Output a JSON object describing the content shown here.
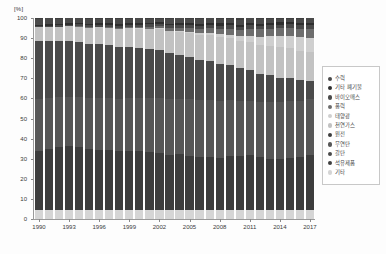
{
  "axes": {
    "unit_label": "[%]",
    "y_ticks": [
      "0",
      "10",
      "20",
      "30",
      "40",
      "50",
      "60",
      "70",
      "80",
      "90",
      "100"
    ],
    "x_ticks": [
      "1990",
      "1993",
      "1996",
      "1999",
      "2002",
      "2005",
      "2008",
      "2011",
      "2014",
      "2017"
    ]
  },
  "legend": {
    "items": [
      {
        "label": "수력",
        "color": "#4a4a4a"
      },
      {
        "label": "기타 폐기물",
        "color": "#2e2e2e"
      },
      {
        "label": "바이오매스",
        "color": "#4a4a4a"
      },
      {
        "label": "풍력",
        "color": "#6d6d6d"
      },
      {
        "label": "태양광",
        "color": "#cfcfcf"
      },
      {
        "label": "천연가스",
        "color": "#c2c2c2"
      },
      {
        "label": "원전",
        "color": "#3d3d3d"
      },
      {
        "label": "무연탄",
        "color": "#575757"
      },
      {
        "label": "갈탄",
        "color": "#4a4a4a"
      },
      {
        "label": "석유제품",
        "color": "#3f3f3f"
      },
      {
        "label": "기타",
        "color": "#d5d5d5"
      }
    ]
  },
  "chart_data": {
    "type": "area",
    "title": "",
    "xlabel": "",
    "ylabel": "[%]",
    "ylim": [
      0,
      100
    ],
    "grid": false,
    "legend_position": "right",
    "stacked": true,
    "normalized_percent": true,
    "x": [
      1990,
      1991,
      1992,
      1993,
      1994,
      1995,
      1996,
      1997,
      1998,
      1999,
      2000,
      2001,
      2002,
      2003,
      2004,
      2005,
      2006,
      2007,
      2008,
      2009,
      2010,
      2011,
      2012,
      2013,
      2014,
      2015,
      2016,
      2017
    ],
    "series": [
      {
        "name": "기타",
        "color": "#d5d5d5",
        "values": [
          4.3,
          4.3,
          4.3,
          4.3,
          4.3,
          4.3,
          4.4,
          4.4,
          4.4,
          4.4,
          4.4,
          4.4,
          4.4,
          4.4,
          4.4,
          4.4,
          4.4,
          4.4,
          4.4,
          4.5,
          4.5,
          4.5,
          4.5,
          4.5,
          4.6,
          4.6,
          4.7,
          4.7
        ]
      },
      {
        "name": "원전",
        "color": "#3d3d3d",
        "values": [
          29.5,
          30.5,
          31.5,
          32.0,
          31.5,
          30.5,
          30.0,
          30.0,
          29.5,
          29.5,
          29.5,
          29.0,
          28.5,
          28.0,
          28.0,
          27.5,
          27.0,
          27.0,
          27.0,
          28.0,
          28.0,
          28.5,
          28.0,
          27.0,
          27.0,
          27.5,
          28.0,
          28.5
        ]
      },
      {
        "name": "무연탄",
        "color": "#575757",
        "values": [
          26.0,
          25.5,
          25.0,
          24.5,
          25.0,
          25.5,
          26.0,
          26.0,
          26.0,
          26.5,
          26.5,
          27.0,
          27.5,
          28.0,
          28.0,
          28.5,
          29.0,
          29.0,
          29.0,
          28.5,
          28.5,
          28.0,
          28.5,
          29.5,
          30.0,
          30.0,
          30.0,
          29.5
        ]
      },
      {
        "name": "갈탄",
        "color": "#4a4a4a",
        "values": [
          29.0,
          28.5,
          28.0,
          28.0,
          27.5,
          27.0,
          26.5,
          26.0,
          25.5,
          25.0,
          24.5,
          24.0,
          23.5,
          23.0,
          22.0,
          21.0,
          20.5,
          20.0,
          19.0,
          18.0,
          17.0,
          16.0,
          15.0,
          14.0,
          13.0,
          12.0,
          11.0,
          9.5
        ]
      },
      {
        "name": "천연가스",
        "color": "#c2c2c2",
        "values": [
          6.5,
          6.5,
          6.8,
          7.0,
          7.5,
          8.0,
          8.5,
          8.8,
          9.3,
          9.5,
          9.8,
          10.2,
          10.8,
          11.0,
          11.5,
          12.0,
          12.5,
          13.0,
          14.0,
          13.5,
          14.0,
          14.5,
          15.0,
          15.5,
          16.0,
          16.0,
          15.5,
          15.0
        ]
      },
      {
        "name": "태양광",
        "color": "#cfcfcf",
        "values": [
          0.0,
          0.0,
          0.0,
          0.0,
          0.0,
          0.0,
          0.0,
          0.0,
          0.0,
          0.0,
          0.1,
          0.1,
          0.2,
          0.3,
          0.4,
          0.6,
          0.8,
          1.0,
          1.3,
          2.0,
          2.5,
          3.3,
          4.3,
          5.0,
          5.8,
          6.5,
          7.0,
          7.5
        ]
      },
      {
        "name": "풍력",
        "color": "#6d6d6d",
        "values": [
          0.0,
          0.0,
          0.0,
          0.0,
          0.1,
          0.1,
          0.2,
          0.3,
          0.4,
          0.5,
          0.7,
          0.8,
          1.0,
          1.2,
          1.5,
          1.8,
          2.0,
          2.3,
          2.6,
          2.9,
          3.2,
          3.5,
          3.7,
          3.9,
          4.1,
          4.3,
          4.5,
          4.7
        ]
      },
      {
        "name": "바이오매스",
        "color": "#4a4a4a",
        "values": [
          0.8,
          0.9,
          0.9,
          0.9,
          1.0,
          1.0,
          1.0,
          1.1,
          1.1,
          1.2,
          1.2,
          1.3,
          1.3,
          1.4,
          1.5,
          1.6,
          1.7,
          1.7,
          1.8,
          1.8,
          1.8,
          1.9,
          1.9,
          1.9,
          2.0,
          2.0,
          2.0,
          2.0
        ]
      },
      {
        "name": "기타 폐기물",
        "color": "#2e2e2e",
        "values": [
          0.6,
          0.6,
          0.6,
          0.6,
          0.7,
          0.7,
          0.7,
          0.7,
          0.8,
          0.8,
          0.8,
          0.9,
          0.9,
          0.9,
          1.0,
          1.0,
          1.0,
          1.1,
          1.1,
          1.1,
          1.1,
          1.1,
          1.2,
          1.2,
          1.2,
          1.2,
          1.2,
          1.2
        ]
      },
      {
        "name": "수력",
        "color": "#4a4a4a",
        "values": [
          3.0,
          3.0,
          2.6,
          2.5,
          2.2,
          2.6,
          2.4,
          2.4,
          2.6,
          2.3,
          2.3,
          2.0,
          1.6,
          2.5,
          2.4,
          2.3,
          2.5,
          2.3,
          2.3,
          2.3,
          2.5,
          2.5,
          2.5,
          2.1,
          2.0,
          1.6,
          2.1,
          2.2
        ]
      },
      {
        "name": "석유제품",
        "color": "#3f3f3f",
        "values": [
          0.3,
          0.2,
          0.3,
          0.2,
          0.2,
          0.3,
          0.3,
          0.3,
          0.4,
          0.3,
          0.2,
          0.3,
          0.3,
          0.3,
          0.2,
          0.3,
          0.6,
          0.2,
          0.5,
          0.4,
          0.9,
          0.2,
          0.4,
          0.4,
          0.3,
          0.3,
          0.5,
          0.2
        ]
      }
    ]
  }
}
